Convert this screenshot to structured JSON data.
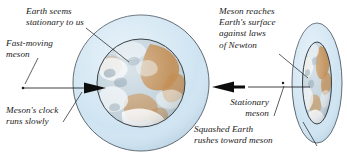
{
  "figure": {
    "background_color": "#ffffff",
    "width": 347,
    "height": 154
  },
  "colors": {
    "atmosphere_fill": "#cfe4f2",
    "atmosphere_stroke": "#4a5560",
    "earth_outline": "#3a4248",
    "ocean": "#b9c9d4",
    "land": "#c08a4e",
    "cloud": "#f4f7f9",
    "text": "#1a1a1a",
    "leader_line": "#2b2b2b",
    "arrow": "#111111"
  },
  "panels": [
    {
      "name": "left-panel",
      "label": "Earth frame of reference",
      "earth_shape": "circle",
      "atmosphere_shape": "circle"
    },
    {
      "name": "right-panel",
      "label": "Meson frame of reference",
      "earth_shape": "ellipse-squashed",
      "atmosphere_shape": "ellipse-squashed"
    }
  ],
  "captions": {
    "earth_seems": "Earth seems\nstationary to us",
    "fast_moving_meson": "Fast-moving\nmeson",
    "mesons_clock": "Meson's clock\nruns slowly",
    "meson_reaches": "Meson reaches\nEarth's surface\nagainst laws\nof Newton",
    "stationary_meson": "Stationary\nmeson",
    "squashed_earth": "Squashed Earth\nrushes toward meson"
  },
  "arrows": [
    {
      "name": "left-meson-arrow",
      "direction": "right",
      "description": "fast-moving meson travelling toward Earth"
    },
    {
      "name": "right-earth-arrow",
      "direction": "left",
      "description": "squashed Earth rushing toward stationary meson"
    }
  ]
}
